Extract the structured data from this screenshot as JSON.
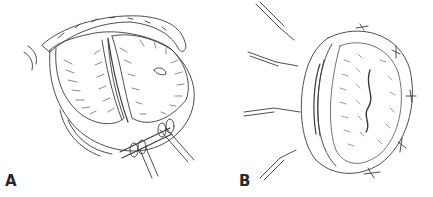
{
  "figure": {
    "panels": [
      {
        "label": "A",
        "description": "heart-valve-leaflets-retracted"
      },
      {
        "label": "B",
        "description": "valve-orifice-with-sutures"
      }
    ],
    "colors": {
      "line": "#3a3a3a",
      "background": "#ffffff",
      "label": "#2a2a2a"
    }
  }
}
